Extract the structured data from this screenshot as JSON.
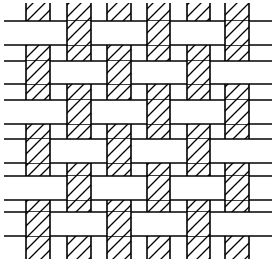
{
  "diagram": {
    "type": "plain-weave",
    "width": 276,
    "height": 267,
    "stroke_color": "#000000",
    "fill_color": "#ffffff",
    "stroke_width": 1.6,
    "hatch_spacing": 12,
    "warps": [
      {
        "x": 26,
        "w": 24
      },
      {
        "x": 67,
        "w": 24
      },
      {
        "x": 107,
        "w": 24
      },
      {
        "x": 147,
        "w": 23
      },
      {
        "x": 187,
        "w": 23
      },
      {
        "x": 225,
        "w": 24
      }
    ],
    "warp_top": 3,
    "warp_bottom": 259,
    "wefts": [
      {
        "y": 21,
        "h": 24
      },
      {
        "y": 61,
        "h": 23
      },
      {
        "y": 100,
        "h": 24
      },
      {
        "y": 139,
        "h": 24
      },
      {
        "y": 176,
        "h": 24
      },
      {
        "y": 212,
        "h": 24
      }
    ],
    "weft_left": 4,
    "weft_right": 272,
    "weft_over_rule": "row even index: weft over warps with even index (0,2,4); row odd index: weft over warps with odd index (1,3,5)"
  }
}
